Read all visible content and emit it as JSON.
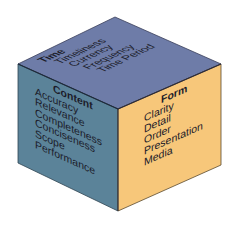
{
  "diagram": {
    "type": "isometric-cube",
    "faces": {
      "top": {
        "heading": "Time",
        "items": [
          "Timeliness",
          "Currency",
          "Frequency",
          "Time Period"
        ],
        "color": "#6e7ca8"
      },
      "left": {
        "heading": "Content",
        "items": [
          "Accuracy",
          "Relevance",
          "Completeness",
          "Conciseness",
          "Scope",
          "Performance"
        ],
        "color": "#5b8399"
      },
      "right": {
        "heading": "Form",
        "items": [
          "Clarity",
          "Detail",
          "Order",
          "Presentation",
          "Media"
        ],
        "color": "#f7c77a"
      }
    },
    "edge_color": "#2a2a3a",
    "text_color": "#1c1c2a"
  }
}
